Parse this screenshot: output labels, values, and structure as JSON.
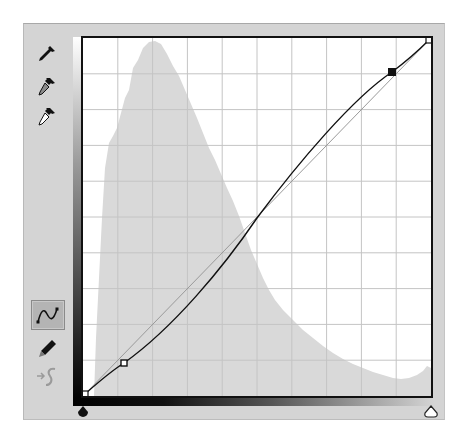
{
  "tools": [
    {
      "name": "black-point-eyedropper",
      "state": "default"
    },
    {
      "name": "gray-point-eyedropper",
      "state": "default"
    },
    {
      "name": "white-point-eyedropper",
      "state": "default"
    },
    {
      "name": "curve-edit-points",
      "state": "selected"
    },
    {
      "name": "pencil-draw",
      "state": "default"
    },
    {
      "name": "smooth-curve",
      "state": "disabled"
    }
  ],
  "graph": {
    "grid_divisions": 10,
    "input_range": [
      0,
      255
    ],
    "output_range": [
      0,
      255
    ],
    "curve_points": [
      {
        "input": 0,
        "output": 0,
        "selected": false
      },
      {
        "input": 29,
        "output": 22,
        "selected": false
      },
      {
        "input": 227,
        "output": 234,
        "selected": true
      },
      {
        "input": 255,
        "output": 255,
        "selected": false
      }
    ],
    "colors": {
      "curve": "#111111",
      "baseline": "#9a9a9a",
      "histogram": "#d8d8d8",
      "grid": "#c4c4c4",
      "frame": "#111111"
    }
  },
  "sliders": {
    "black_point": {
      "value": 0,
      "shape": "filled"
    },
    "white_point": {
      "value": 255,
      "shape": "hollow"
    }
  }
}
